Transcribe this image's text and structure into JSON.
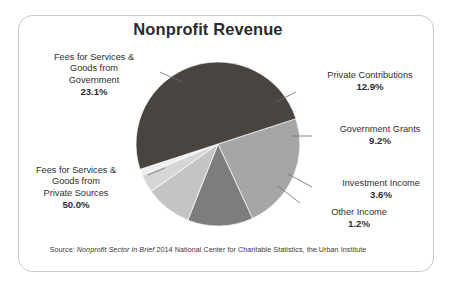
{
  "card": {
    "title": "Nonprofit Revenue",
    "border_color": "#c9c9c9",
    "background": "#ffffff"
  },
  "source": {
    "prefix": "Source: ",
    "italic": "Nonprofit Sector in Brief",
    "suffix": " 2014 National Center for Charitable Statistics, the Urban Institute",
    "full": "Source: Nonprofit Sector in Brief 2014 National Center for Charitable Statistics, the Urban Institute"
  },
  "labels": {
    "government": {
      "name": "Fees for Services &",
      "line2": "Goods from",
      "line3": "Government",
      "value": "23.1%"
    },
    "private_sources": {
      "name": "Fees for Services &",
      "line2": "Goods from",
      "line3": "Private Sources",
      "value": "50.0%"
    },
    "contributions": {
      "name": "Private Contributions",
      "value": "12.9%"
    },
    "grants": {
      "name": "Government Grants",
      "value": "9.2%"
    },
    "investment": {
      "name": "Investment Income",
      "value": "3.6%"
    },
    "other": {
      "name": "Other Income",
      "value": "1.2%"
    }
  },
  "chart_data": {
    "type": "pie",
    "title": "Nonprofit Revenue",
    "xlabel": "",
    "ylabel": "",
    "legend": "none",
    "labels_position": "outside-with-leader-lines",
    "units": "percent",
    "total": 100.0,
    "categories": [
      "Fees for Services & Goods from Government",
      "Private Contributions",
      "Government Grants",
      "Investment Income",
      "Other Income",
      "Fees for Services & Goods from Private Sources"
    ],
    "values": [
      23.1,
      12.9,
      9.2,
      3.6,
      1.2,
      50.0
    ],
    "value_labels": [
      "23.1%",
      "12.9%",
      "9.2%",
      "3.6%",
      "1.2%",
      "50.0%"
    ],
    "colors": [
      "#a6a6a6",
      "#7d7d7d",
      "#c4c4c4",
      "#d6d6d6",
      "#eeeeee",
      "#4a4441"
    ],
    "start_angle_deg": -18,
    "direction": "clockwise",
    "center": [
      218,
      144
    ],
    "radius": 82,
    "annotations": [
      "Source: Nonprofit Sector in Brief 2014 National Center for Charitable Statistics, the Urban Institute"
    ]
  }
}
